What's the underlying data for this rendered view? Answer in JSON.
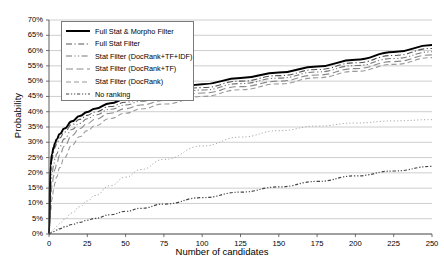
{
  "chart_data": {
    "type": "line",
    "title": "",
    "xlabel": "Number of candidates",
    "ylabel": "Probability",
    "xlim": [
      0,
      250
    ],
    "ylim": [
      0,
      0.7
    ],
    "xticks": [
      0,
      25,
      50,
      75,
      100,
      125,
      150,
      175,
      200,
      225,
      250
    ],
    "ytick_labels": [
      "0%",
      "5%",
      "10%",
      "15%",
      "20%",
      "25%",
      "30%",
      "35%",
      "40%",
      "45%",
      "50%",
      "55%",
      "60%",
      "65%",
      "70%"
    ],
    "yticks": [
      0,
      0.05,
      0.1,
      0.15,
      0.2,
      0.25,
      0.3,
      0.35,
      0.4,
      0.45,
      0.5,
      0.55,
      0.6,
      0.65,
      0.7
    ],
    "grid": true,
    "legend_position": "upper left",
    "x": [
      0,
      1,
      2,
      3,
      4,
      5,
      7,
      10,
      15,
      20,
      25,
      30,
      40,
      50,
      60,
      75,
      100,
      125,
      150,
      175,
      200,
      225,
      250
    ],
    "series": [
      {
        "name": "Full Stat & Morpho Filter",
        "style": "solid",
        "color": "#000000",
        "width": 2.0,
        "values": [
          0.0,
          0.225,
          0.262,
          0.283,
          0.298,
          0.31,
          0.327,
          0.345,
          0.369,
          0.386,
          0.399,
          0.41,
          0.428,
          0.442,
          0.453,
          0.467,
          0.49,
          0.51,
          0.528,
          0.548,
          0.57,
          0.595,
          0.618
        ]
      },
      {
        "name": "Full Stat Filter",
        "style": "dashdot",
        "color": "#555555",
        "width": 1.1,
        "values": [
          0.0,
          0.205,
          0.245,
          0.268,
          0.284,
          0.296,
          0.314,
          0.333,
          0.358,
          0.375,
          0.388,
          0.399,
          0.417,
          0.431,
          0.442,
          0.456,
          0.479,
          0.5,
          0.518,
          0.538,
          0.56,
          0.584,
          0.607
        ]
      },
      {
        "name": "Stat Filter (DocRank+TF+IDF)",
        "style": "dashdotdot",
        "color": "#777777",
        "width": 1.1,
        "values": [
          0.0,
          0.15,
          0.196,
          0.225,
          0.246,
          0.262,
          0.286,
          0.311,
          0.342,
          0.362,
          0.377,
          0.389,
          0.408,
          0.422,
          0.434,
          0.448,
          0.471,
          0.492,
          0.51,
          0.53,
          0.551,
          0.574,
          0.596
        ]
      },
      {
        "name": "Stat Filter (DocRank+TF)",
        "style": "longdash",
        "color": "#8a8a8a",
        "width": 1.1,
        "values": [
          0.0,
          0.115,
          0.16,
          0.19,
          0.213,
          0.231,
          0.258,
          0.287,
          0.322,
          0.345,
          0.361,
          0.375,
          0.395,
          0.41,
          0.422,
          0.437,
          0.461,
          0.482,
          0.5,
          0.52,
          0.541,
          0.564,
          0.586
        ]
      },
      {
        "name": "Stat Filter (DocRank)",
        "style": "dash",
        "color": "#9a9a9a",
        "width": 1.1,
        "values": [
          0.0,
          0.075,
          0.115,
          0.145,
          0.168,
          0.187,
          0.217,
          0.25,
          0.291,
          0.318,
          0.338,
          0.354,
          0.378,
          0.395,
          0.409,
          0.425,
          0.45,
          0.472,
          0.491,
          0.511,
          0.532,
          0.555,
          0.577
        ]
      },
      {
        "name": "Stat Filter (DocRank) dotted",
        "hidden_from_legend": true,
        "style": "dotted",
        "color": "#aaaaaa",
        "width": 1.0,
        "values": [
          0.0,
          0.005,
          0.01,
          0.015,
          0.02,
          0.025,
          0.034,
          0.048,
          0.069,
          0.089,
          0.108,
          0.126,
          0.158,
          0.186,
          0.211,
          0.244,
          0.288,
          0.317,
          0.338,
          0.353,
          0.363,
          0.37,
          0.374
        ]
      },
      {
        "name": "No ranking",
        "style": "dashdotdot-dense",
        "color": "#444444",
        "width": 1.2,
        "values": [
          0.0,
          0.003,
          0.005,
          0.008,
          0.01,
          0.013,
          0.017,
          0.023,
          0.031,
          0.038,
          0.045,
          0.051,
          0.063,
          0.074,
          0.084,
          0.098,
          0.119,
          0.137,
          0.154,
          0.172,
          0.19,
          0.206,
          0.221
        ]
      }
    ],
    "legend_entries": [
      {
        "label": "Full Stat & Morpho Filter",
        "style": "solid",
        "color": "#000000",
        "width": 2.0
      },
      {
        "label": "Full Stat Filter",
        "style": "dashdot",
        "color": "#555555",
        "width": 1.1
      },
      {
        "label": "Stat Filter (DocRank+TF+IDF)",
        "style": "dashdotdot",
        "color": "#777777",
        "width": 1.1
      },
      {
        "label": "Stat Filter (DocRank+TF)",
        "style": "longdash",
        "color": "#8a8a8a",
        "width": 1.1
      },
      {
        "label": "Stat Filter (DocRank)",
        "style": "dash",
        "color": "#9a9a9a",
        "width": 1.1
      },
      {
        "label": "No ranking",
        "style": "dashdotdot-dense",
        "color": "#444444",
        "width": 1.2
      }
    ]
  }
}
